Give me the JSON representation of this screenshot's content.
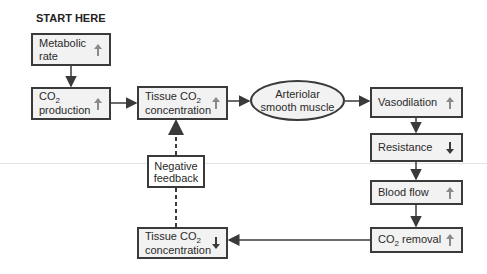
{
  "title": "START HERE",
  "colors": {
    "box_border": "#3a3a3a",
    "box_fill": "#f2f2f2",
    "arrow_up": "#8a8a8a",
    "arrow_down": "#3a3a3a",
    "connector": "#3a3a3a"
  },
  "nodes": {
    "metabolic_rate": {
      "line1": "Metabolic",
      "line2": "rate",
      "direction": "up"
    },
    "co2_production": {
      "line1_pre": "CO",
      "line1_sub": "2",
      "line2": "production",
      "direction": "up"
    },
    "tissue_co2_up": {
      "line1_pre": "Tissue CO",
      "line1_sub": "2",
      "line2": "concentration",
      "direction": "up"
    },
    "arteriolar": {
      "line1": "Arteriolar",
      "line2": "smooth muscle"
    },
    "vasodilation": {
      "label": "Vasodilation",
      "direction": "up"
    },
    "resistance": {
      "label": "Resistance",
      "direction": "down"
    },
    "blood_flow": {
      "label": "Blood flow",
      "direction": "up"
    },
    "co2_removal": {
      "pre": "CO",
      "sub": "2",
      "post": " removal",
      "direction": "up"
    },
    "tissue_co2_down": {
      "line1_pre": "Tissue CO",
      "line1_sub": "2",
      "line2": "concentration",
      "direction": "down"
    },
    "negative_feedback": {
      "line1": "Negative",
      "line2": "feedback"
    }
  },
  "edges": [
    {
      "from": "metabolic_rate",
      "to": "co2_production",
      "style": "solid"
    },
    {
      "from": "co2_production",
      "to": "tissue_co2_up",
      "style": "solid"
    },
    {
      "from": "tissue_co2_up",
      "to": "arteriolar",
      "style": "solid"
    },
    {
      "from": "arteriolar",
      "to": "vasodilation",
      "style": "solid"
    },
    {
      "from": "vasodilation",
      "to": "resistance",
      "style": "solid"
    },
    {
      "from": "resistance",
      "to": "blood_flow",
      "style": "solid"
    },
    {
      "from": "blood_flow",
      "to": "co2_removal",
      "style": "solid"
    },
    {
      "from": "co2_removal",
      "to": "tissue_co2_down",
      "style": "solid"
    },
    {
      "from": "tissue_co2_down",
      "to": "tissue_co2_up",
      "style": "dashed",
      "via": "negative_feedback"
    }
  ]
}
